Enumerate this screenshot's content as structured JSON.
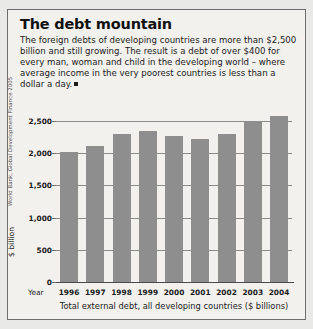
{
  "panel": {
    "title": "The debt mountain",
    "intro": "The foreign debts of developing countries are more than $2,500 billion and still growing. The result is a debt of over $400 for every man, woman and child in the developing world – where average income in the very poorest countries is less than a dollar a day.",
    "year_axis_word": "Year",
    "caption": "Total external debt, all developing countries ($ billions)",
    "source": "World Bank, Global Development Finance 2005"
  },
  "chart_data": {
    "type": "bar",
    "title": "The debt mountain",
    "xlabel": "Year",
    "ylabel": "$ billion",
    "categories": [
      "1996",
      "1997",
      "1998",
      "1999",
      "2000",
      "2001",
      "2002",
      "2003",
      "2004"
    ],
    "values": [
      2020,
      2110,
      2300,
      2340,
      2260,
      2220,
      2290,
      2500,
      2570
    ],
    "yticks": [
      "0",
      "500",
      "1,000",
      "1,500",
      "2,000",
      "2,500"
    ],
    "ytick_values": [
      0,
      500,
      1000,
      1500,
      2000,
      2500
    ],
    "ylim": [
      0,
      2700
    ],
    "grid": true,
    "legend": false,
    "bar_color": "#8e8e8e",
    "caption": "Total external debt, all developing countries ($ billions)",
    "source": "World Bank, Global Development Finance 2005"
  }
}
